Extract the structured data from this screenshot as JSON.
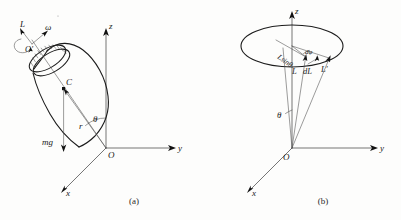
{
  "figure": {
    "background_color": "#fdfdfc",
    "ink_color": "#1c1c1c",
    "panel_a": {
      "caption": "(a)",
      "title_semantic": "spinning top precessing about vertical axis",
      "axes": {
        "z_label": "z",
        "y_label": "y",
        "x_label": "x",
        "origin_label": "O"
      },
      "labels": {
        "angular_momentum": "L",
        "angular_velocity": "ω",
        "pivot_top": "O′",
        "center_of_mass": "C",
        "radius": "r",
        "weight": "mg",
        "tilt_angle": "θ"
      }
    },
    "panel_b": {
      "caption": "(b)",
      "title_semantic": "precession cone traced by angular momentum vector",
      "axes": {
        "z_label": "z",
        "y_label": "y",
        "x_label": "x",
        "origin_label": "O"
      },
      "labels": {
        "cone_radius": "Lsinθ",
        "angular_momentum_initial": "L",
        "angular_momentum_change": "dL",
        "angular_momentum_final": "L′",
        "precession_angle": "dφ",
        "tilt_angle": "θ"
      }
    }
  }
}
